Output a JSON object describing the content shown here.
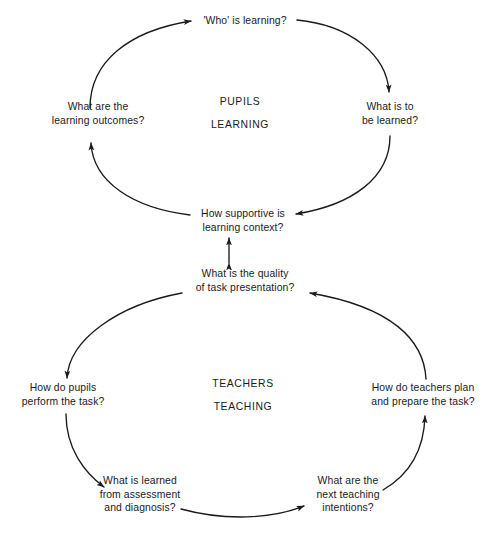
{
  "diagram": {
    "stroke_color": "#1a1a1a",
    "text_color": "#1a1a1a",
    "background_color": "#ffffff",
    "top_cycle": {
      "center_label_line1": "PUPILS",
      "center_label_line2": "LEARNING",
      "nodes": {
        "top": {
          "line1": "'Who' is learning?"
        },
        "right": {
          "line1": "What is to",
          "line2": "be learned?"
        },
        "bottom": {
          "line1": "How supportive is",
          "line2": "learning context?"
        },
        "left": {
          "line1": "What are the",
          "line2": "learning outcomes?"
        }
      }
    },
    "bottom_cycle": {
      "center_label_line1": "TEACHERS",
      "center_label_line2": "TEACHING",
      "nodes": {
        "top": {
          "line1": "What is the quality",
          "line2": "of task presentation?"
        },
        "left": {
          "line1": "How do pupils",
          "line2": "perform the task?"
        },
        "bottom_left": {
          "line1": "What is learned",
          "line2": "from assessment",
          "line3": "and diagnosis?"
        },
        "bottom_right": {
          "line1": "What are the",
          "line2": "next teaching",
          "line3": "intentions?"
        },
        "right": {
          "line1": "How do teachers plan",
          "line2": "and prepare the task?"
        }
      }
    },
    "connector": {
      "name": "double-headed-vertical-arrow",
      "direction": "bidirectional"
    }
  }
}
